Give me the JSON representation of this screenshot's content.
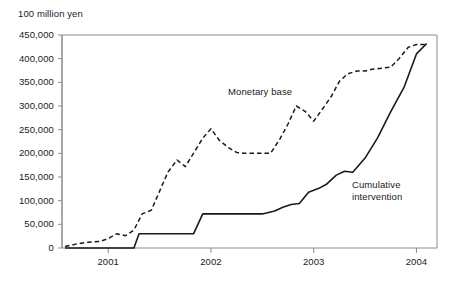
{
  "chart_data": {
    "type": "line",
    "title": "",
    "ylabel": "100 million yen",
    "xlabel": "",
    "ylim": [
      0,
      450000
    ],
    "ytick_labels": [
      "450,000",
      "400,000",
      "350,000",
      "300,000",
      "250,000",
      "200,000",
      "150,000",
      "100,000",
      "50,000",
      "0"
    ],
    "ytick_values": [
      450000,
      400000,
      350000,
      300000,
      250000,
      200000,
      150000,
      100000,
      50000,
      0
    ],
    "xtick_labels": [
      "2001",
      "2002",
      "2003",
      "2004"
    ],
    "xtick_values": [
      2001,
      2002,
      2003,
      2004
    ],
    "xlim": [
      2000.55,
      2004.2
    ],
    "grid": false,
    "legend_position": "inline-annotations",
    "series": [
      {
        "name": "Monetary base",
        "style": "dashed",
        "color": "#1a1a1a",
        "label_annotation": "Monetary base",
        "x": [
          2000.58,
          2000.7,
          2000.8,
          2000.92,
          2001.0,
          2001.08,
          2001.17,
          2001.25,
          2001.33,
          2001.42,
          2001.5,
          2001.58,
          2001.67,
          2001.75,
          2001.83,
          2001.92,
          2002.0,
          2002.08,
          2002.17,
          2002.25,
          2002.33,
          2002.42,
          2002.5,
          2002.58,
          2002.67,
          2002.75,
          2002.83,
          2002.92,
          2003.0,
          2003.08,
          2003.17,
          2003.25,
          2003.33,
          2003.42,
          2003.5,
          2003.58,
          2003.67,
          2003.75,
          2003.83,
          2003.92,
          2004.0,
          2004.1
        ],
        "values": [
          3000,
          9000,
          12000,
          14000,
          20000,
          30000,
          26000,
          38000,
          72000,
          80000,
          120000,
          160000,
          186000,
          172000,
          200000,
          232000,
          252000,
          228000,
          212000,
          202000,
          200000,
          200000,
          200000,
          200000,
          230000,
          262000,
          300000,
          288000,
          268000,
          292000,
          320000,
          352000,
          368000,
          374000,
          374000,
          378000,
          380000,
          382000,
          400000,
          424000,
          430000,
          430000
        ]
      },
      {
        "name": "Cumulative intervention",
        "style": "solid",
        "color": "#1a1a1a",
        "label_annotation": "Cumulative intervention",
        "x": [
          2000.58,
          2000.92,
          2001.25,
          2001.3,
          2001.7,
          2001.83,
          2001.92,
          2002.5,
          2002.62,
          2002.7,
          2002.78,
          2002.86,
          2002.95,
          2003.05,
          2003.12,
          2003.22,
          2003.3,
          2003.38,
          2003.5,
          2003.62,
          2003.75,
          2003.88,
          2004.0,
          2004.1
        ],
        "values": [
          0,
          0,
          0,
          30000,
          30000,
          30000,
          72000,
          72000,
          78000,
          86000,
          92000,
          94000,
          118000,
          126000,
          134000,
          154000,
          162000,
          160000,
          190000,
          232000,
          288000,
          340000,
          410000,
          432000
        ]
      }
    ],
    "annotations": [
      {
        "text": "Monetary base",
        "x_px": 228,
        "y_px": 86
      },
      {
        "text": "Cumulative",
        "x_px": 352,
        "y_px": 179
      },
      {
        "text": "intervention",
        "x_px": 352,
        "y_px": 191
      }
    ]
  },
  "axis": {
    "unit_label": "100 million yen"
  },
  "labels": {
    "monetary_base": "Monetary base",
    "cumulative_line1": "Cumulative",
    "cumulative_line2": "intervention"
  }
}
